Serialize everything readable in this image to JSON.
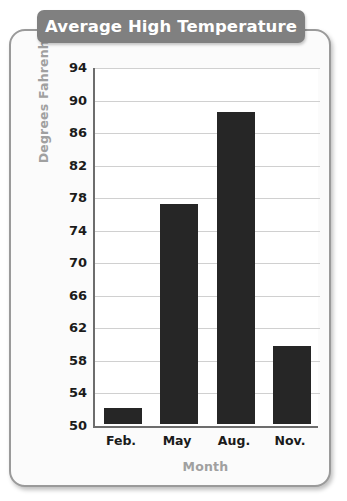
{
  "card": {
    "border_color": "#9a9a9a",
    "background_color": "#fbfbfb"
  },
  "chart_data": {
    "type": "bar",
    "title": "Average High Temperature",
    "xlabel": "Month",
    "ylabel": "Degrees Fahrenheit",
    "categories": [
      "Feb.",
      "May",
      "Aug.",
      "Nov."
    ],
    "values": [
      52,
      77,
      88.4,
      59.6
    ],
    "ylim": [
      50,
      94
    ],
    "yticks": [
      50,
      54,
      58,
      62,
      66,
      70,
      74,
      78,
      82,
      86,
      90,
      94
    ],
    "ytick_labels": [
      "50",
      "54",
      "58",
      "62",
      "66",
      "70",
      "74",
      "78",
      "82",
      "86",
      "90",
      "94"
    ],
    "grid": true,
    "legend": false,
    "bar_color": "#262626",
    "title_background": "#808080",
    "title_color": "#ffffff",
    "axis_label_color": "#a0a0a0",
    "gridline_color": "#d0d0d0",
    "plot_background": "#ffffff"
  }
}
